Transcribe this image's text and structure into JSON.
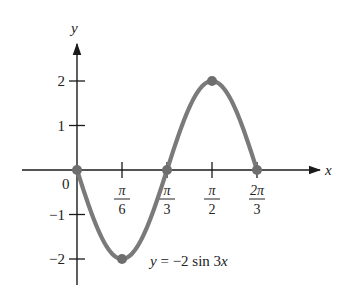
{
  "chart_data": {
    "type": "line",
    "title": "",
    "xlabel": "x",
    "ylabel": "y",
    "equation_label": "y = −2 sin 3x",
    "function": "y = -2 sin 3x",
    "origin_label": "0",
    "x_ticks": [
      {
        "value": 0.5235987756,
        "num": "π",
        "den": "6"
      },
      {
        "value": 1.0471975512,
        "num": "π",
        "den": "3"
      },
      {
        "value": 1.5707963268,
        "num": "π",
        "den": "2"
      },
      {
        "value": 2.0943951024,
        "num": "2π",
        "den": "3"
      }
    ],
    "y_ticks": [
      {
        "value": 2,
        "label": "2"
      },
      {
        "value": 1,
        "label": "1"
      },
      {
        "value": -1,
        "label": "−1"
      },
      {
        "value": -2,
        "label": "−2"
      }
    ],
    "xlim": [
      0,
      2.0943951024
    ],
    "ylim": [
      -2.5,
      3.0
    ],
    "grid": false,
    "series": [
      {
        "name": "y = -2 sin 3x",
        "color": "#7a7a7a",
        "x": [
          0,
          0.5235987756,
          1.0471975512,
          1.5707963268,
          2.0943951024
        ],
        "y": [
          0,
          -2,
          0,
          2,
          0
        ]
      }
    ],
    "highlighted_points": [
      {
        "x": 0,
        "y": 0
      },
      {
        "x": 0.5235987756,
        "y": -2
      },
      {
        "x": 1.0471975512,
        "y": 0
      },
      {
        "x": 1.5707963268,
        "y": 2
      },
      {
        "x": 2.0943951024,
        "y": 0
      }
    ],
    "colors": {
      "axis": "#1a1a1a",
      "curve": "#7a7a7a",
      "point": "#6e6e6e",
      "text": "#222222"
    }
  }
}
